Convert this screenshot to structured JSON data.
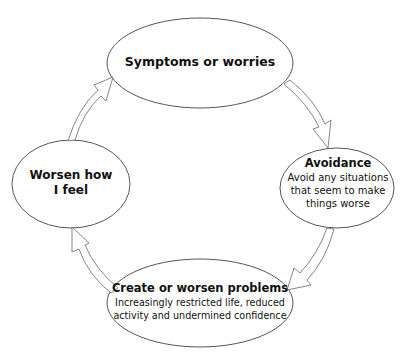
{
  "diagram": {
    "type": "cycle",
    "colors": {
      "background": "#ffffff",
      "stroke": "#555555",
      "text": "#111111"
    },
    "nodes": [
      {
        "id": "symptoms",
        "title": "Symptoms or worries",
        "description": ""
      },
      {
        "id": "avoidance",
        "title": "Avoidance",
        "description_lines": [
          "Avoid any situations",
          "that seem to make",
          "things worse"
        ]
      },
      {
        "id": "problems",
        "title": "Create or worsen problems",
        "description_lines": [
          "Increasingly restricted life, reduced",
          "activity and undermined confidence"
        ]
      },
      {
        "id": "worsen",
        "title_lines": [
          "Worsen how",
          "I feel"
        ]
      }
    ],
    "edges": [
      {
        "from": "symptoms",
        "to": "avoidance",
        "style": "hollow-arrow"
      },
      {
        "from": "avoidance",
        "to": "problems",
        "style": "hollow-arrow"
      },
      {
        "from": "problems",
        "to": "worsen",
        "style": "hollow-arrow"
      },
      {
        "from": "worsen",
        "to": "symptoms",
        "style": "hollow-arrow"
      }
    ]
  }
}
